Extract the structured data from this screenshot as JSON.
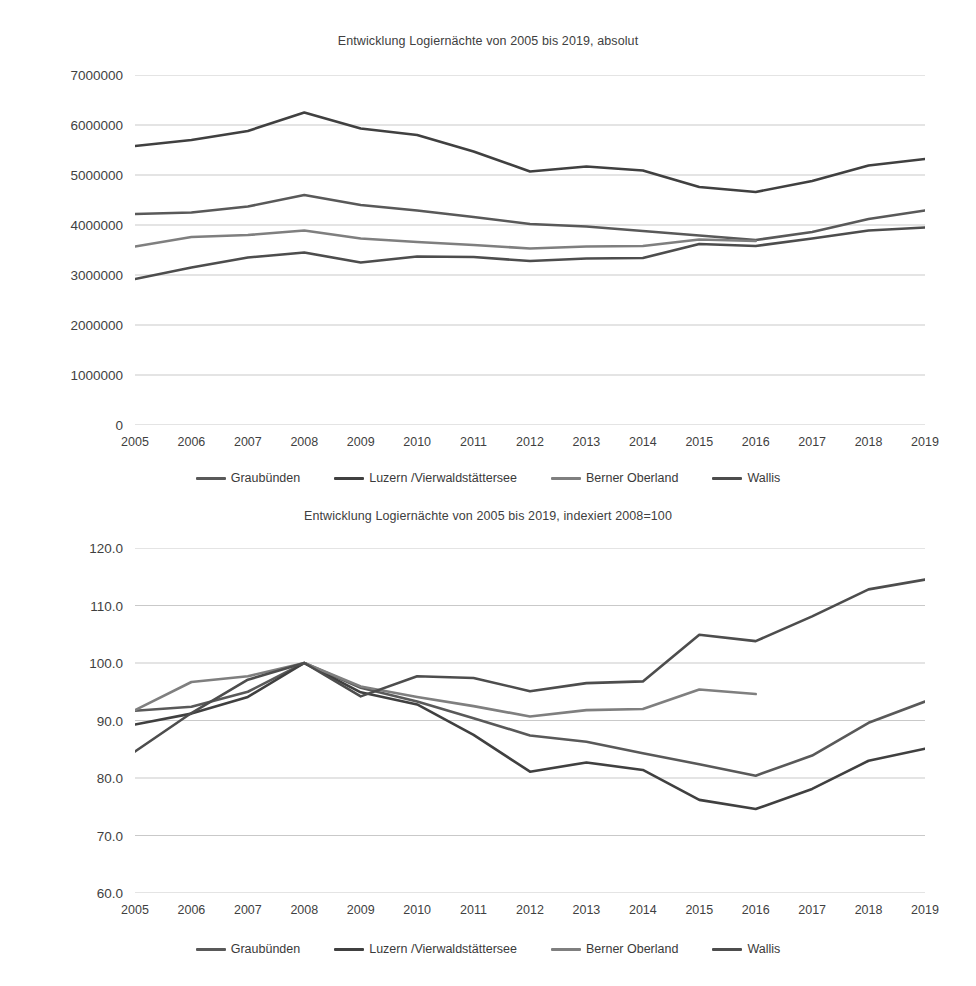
{
  "colors": {
    "graubuenden": "#595959",
    "luzern": "#404040",
    "berner_oberland": "#7f7f7f",
    "wallis": "#4d4d4d",
    "gridline": "#c9c9c9",
    "text": "#3f3f3f"
  },
  "series_names": {
    "graubuenden": "Graubünden",
    "luzern": "Luzern /Vierwaldstättersee",
    "berner_oberland": "Berner Oberland",
    "wallis": "Wallis"
  },
  "chart1": {
    "title": "Entwicklung Logiernächte von 2005 bis 2019, absolut",
    "legend": [
      {
        "label": "Graubünden",
        "color": "#595959"
      },
      {
        "label": "Luzern /Vierwaldstättersee",
        "color": "#404040"
      },
      {
        "label": "Berner Oberland",
        "color": "#7f7f7f"
      },
      {
        "label": "Wallis",
        "color": "#4d4d4d"
      }
    ]
  },
  "chart2": {
    "title": "Entwicklung Logiernächte von 2005 bis 2019, indexiert 2008=100",
    "legend": [
      {
        "label": "Graubünden",
        "color": "#595959"
      },
      {
        "label": "Luzern /Vierwaldstättersee",
        "color": "#404040"
      },
      {
        "label": "Berner Oberland",
        "color": "#7f7f7f"
      },
      {
        "label": "Wallis",
        "color": "#4d4d4d"
      }
    ]
  },
  "chart_data": [
    {
      "type": "line",
      "title": "Entwicklung Logiernächte von 2005 bis 2019, absolut",
      "xlabel": "",
      "ylabel": "",
      "x": [
        2005,
        2006,
        2007,
        2008,
        2009,
        2010,
        2011,
        2012,
        2013,
        2014,
        2015,
        2016,
        2017,
        2018,
        2019
      ],
      "xticklabels": [
        "2005",
        "2006",
        "2007",
        "2008",
        "2009",
        "2010",
        "2011",
        "2012",
        "2013",
        "2014",
        "2015",
        "2016",
        "2017",
        "2018",
        "2019"
      ],
      "ylim": [
        0,
        7000000
      ],
      "yticks": [
        0,
        1000000,
        2000000,
        3000000,
        4000000,
        5000000,
        6000000,
        7000000
      ],
      "yticklabels": [
        "0",
        "1000000",
        "2000000",
        "3000000",
        "4000000",
        "5000000",
        "6000000",
        "7000000"
      ],
      "grid": true,
      "legend_position": "bottom",
      "series": [
        {
          "name": "Graubünden",
          "color": "#595959",
          "values": [
            4220000,
            4250000,
            4370000,
            4600000,
            4400000,
            4290000,
            4160000,
            4020000,
            3970000,
            3880000,
            3790000,
            3700000,
            3860000,
            4120000,
            4290000
          ]
        },
        {
          "name": "Luzern /Vierwaldstättersee",
          "color": "#404040",
          "values": [
            5580000,
            5700000,
            5880000,
            6250000,
            5930000,
            5800000,
            5470000,
            5070000,
            5170000,
            5090000,
            4760000,
            4660000,
            4880000,
            5190000,
            5320000
          ]
        },
        {
          "name": "Berner Oberland",
          "color": "#7f7f7f",
          "values": [
            3570000,
            3760000,
            3800000,
            3890000,
            3730000,
            3660000,
            3600000,
            3530000,
            3570000,
            3580000,
            3710000,
            3680000,
            null,
            null,
            null
          ]
        },
        {
          "name": "Wallis",
          "color": "#4d4d4d",
          "values": [
            2920000,
            3150000,
            3350000,
            3450000,
            3250000,
            3370000,
            3360000,
            3280000,
            3330000,
            3340000,
            3620000,
            3580000,
            3730000,
            3890000,
            3950000
          ]
        }
      ]
    },
    {
      "type": "line",
      "title": "Entwicklung Logiernächte von 2005 bis 2019, indexiert 2008=100",
      "xlabel": "",
      "ylabel": "",
      "x": [
        2005,
        2006,
        2007,
        2008,
        2009,
        2010,
        2011,
        2012,
        2013,
        2014,
        2015,
        2016,
        2017,
        2018,
        2019
      ],
      "xticklabels": [
        "2005",
        "2006",
        "2007",
        "2008",
        "2009",
        "2010",
        "2011",
        "2012",
        "2013",
        "2014",
        "2015",
        "2016",
        "2017",
        "2018",
        "2019"
      ],
      "ylim": [
        60.0,
        120.0
      ],
      "yticks": [
        60.0,
        70.0,
        80.0,
        90.0,
        100.0,
        110.0,
        120.0
      ],
      "yticklabels": [
        "60.0",
        "70.0",
        "80.0",
        "90.0",
        "100.0",
        "110.0",
        "120.0"
      ],
      "grid": true,
      "legend_position": "bottom",
      "series": [
        {
          "name": "Graubünden",
          "color": "#595959",
          "values": [
            91.7,
            92.4,
            95.0,
            100.0,
            95.7,
            93.3,
            90.4,
            87.4,
            86.3,
            84.3,
            82.4,
            80.4,
            83.9,
            89.6,
            93.3
          ]
        },
        {
          "name": "Luzern /Vierwaldstättersee",
          "color": "#404040",
          "values": [
            89.3,
            91.2,
            94.1,
            100.0,
            94.9,
            92.8,
            87.5,
            81.1,
            82.7,
            81.4,
            76.2,
            74.6,
            78.1,
            83.0,
            85.1
          ]
        },
        {
          "name": "Berner Oberland",
          "color": "#7f7f7f",
          "values": [
            91.8,
            96.7,
            97.7,
            100.0,
            95.9,
            94.1,
            92.5,
            90.7,
            91.8,
            92.0,
            95.4,
            94.6,
            null,
            null,
            null
          ]
        },
        {
          "name": "Wallis",
          "color": "#4d4d4d",
          "values": [
            84.6,
            91.3,
            97.1,
            100.0,
            94.2,
            97.7,
            97.4,
            95.1,
            96.5,
            96.8,
            104.9,
            103.8,
            108.1,
            112.8,
            114.5
          ]
        }
      ]
    }
  ]
}
